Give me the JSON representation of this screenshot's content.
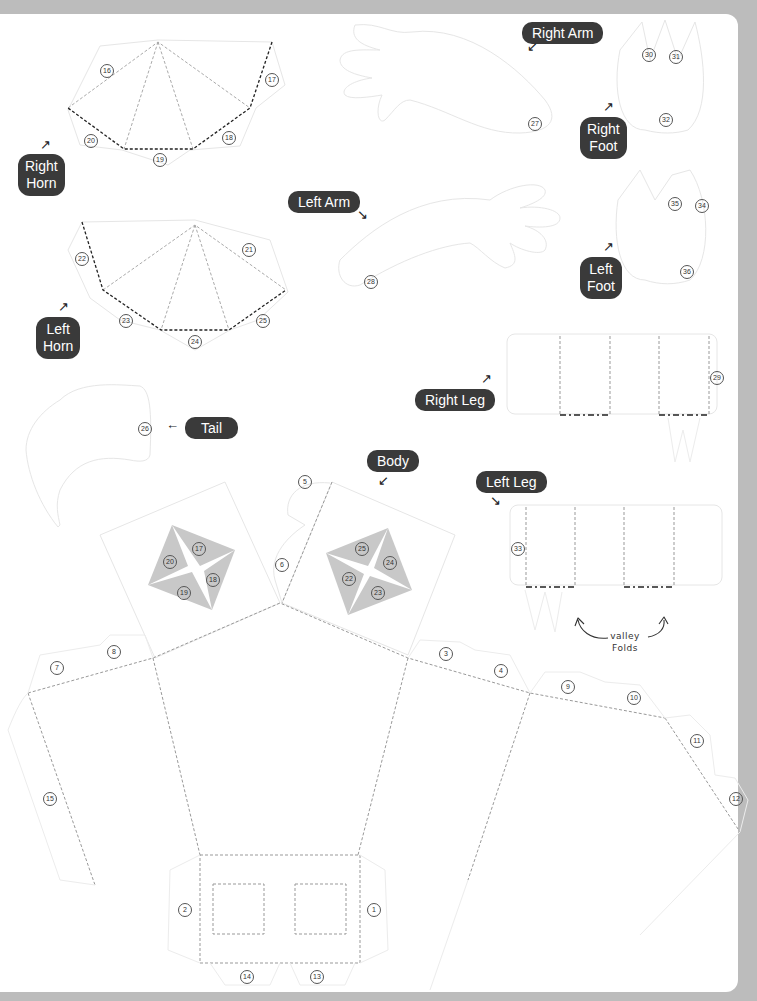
{
  "page": {
    "header_text_clipped": "",
    "background_color": "#bcbcbc",
    "paper_color": "#ffffff",
    "label_color": "#3a3a3a",
    "fold_color": "#999999",
    "mountain_fold_color": "#222222",
    "shade_color": "#c8c8c8"
  },
  "labels": {
    "right_arm": "Right Arm",
    "right_foot_1": "Right",
    "right_foot_2": "Foot",
    "right_horn_1": "Right",
    "right_horn_2": "Horn",
    "left_arm": "Left Arm",
    "left_foot_1": "Left",
    "left_foot_2": "Foot",
    "left_horn_1": "Left",
    "left_horn_2": "Horn",
    "right_leg": "Right Leg",
    "tail": "Tail",
    "body": "Body",
    "left_leg": "Left Leg",
    "valley_folds_1": "valley",
    "valley_folds_2": "Folds"
  },
  "tabs": {
    "n1": "1",
    "n2": "2",
    "n3": "3",
    "n4": "4",
    "n5": "5",
    "n6": "6",
    "n7": "7",
    "n8": "8",
    "n9": "9",
    "n10": "10",
    "n11": "11",
    "n12": "12",
    "n13": "13",
    "n14": "14",
    "n15": "15",
    "n16": "16",
    "n17": "17",
    "n18": "18",
    "n19": "19",
    "n20": "20",
    "n21": "21",
    "n22": "22",
    "n23": "23",
    "n24": "24",
    "n25": "25",
    "n26": "26",
    "n27": "27",
    "n28": "28",
    "n29": "29",
    "n30": "30",
    "n31": "31",
    "n32": "32",
    "n33": "33",
    "n34": "34",
    "n35": "35",
    "n36": "36"
  },
  "body_markers": {
    "left": [
      "17",
      "18",
      "19",
      "20"
    ],
    "right": [
      "25",
      "24",
      "23",
      "22"
    ]
  }
}
